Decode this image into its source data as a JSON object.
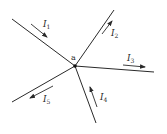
{
  "diagram": {
    "type": "circuit-node-currents",
    "node": {
      "label": "a",
      "x": 75,
      "y": 66,
      "color": "#111111"
    },
    "branches": [
      {
        "id": "1",
        "label_main": "I",
        "label_sub": "1",
        "end": [
          12,
          19
        ],
        "direction": "into-node",
        "arrow": [
          [
            31,
            24
          ],
          [
            47,
            37
          ]
        ],
        "label_pos": [
          43,
          27
        ]
      },
      {
        "id": "2",
        "label_main": "I",
        "label_sub": "2",
        "end": [
          114,
          10
        ],
        "direction": "out-of-node",
        "arrow": [
          [
            102,
            34
          ],
          [
            112,
            21
          ]
        ],
        "label_pos": [
          111,
          36
        ]
      },
      {
        "id": "3",
        "label_main": "I",
        "label_sub": "3",
        "end": [
          154,
          72
        ],
        "direction": "out-of-node",
        "arrow": [
          [
            123,
            65
          ],
          [
            145,
            67
          ]
        ],
        "label_pos": [
          127,
          61
        ]
      },
      {
        "id": "4",
        "label_main": "I",
        "label_sub": "4",
        "end": [
          96,
          123
        ],
        "direction": "into-node",
        "arrow": [
          [
            97,
            107
          ],
          [
            90,
            87
          ]
        ],
        "label_pos": [
          100,
          100
        ]
      },
      {
        "id": "5",
        "label_main": "I",
        "label_sub": "5",
        "end": [
          12,
          102
        ],
        "direction": "out-of-node",
        "arrow": [
          [
            53,
            86
          ],
          [
            30,
            98
          ]
        ],
        "label_pos": [
          43,
          102
        ]
      }
    ],
    "stroke_color": "#2a2a2a"
  }
}
